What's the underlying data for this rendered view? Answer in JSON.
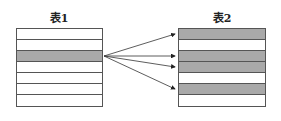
{
  "table1": {
    "title": "表1",
    "rows": [
      {
        "shaded": false
      },
      {
        "shaded": false
      },
      {
        "shaded": true
      },
      {
        "shaded": false
      },
      {
        "shaded": false
      },
      {
        "shaded": false
      },
      {
        "shaded": false
      }
    ]
  },
  "table2": {
    "title": "表2",
    "rows": [
      {
        "shaded": true
      },
      {
        "shaded": false
      },
      {
        "shaded": true
      },
      {
        "shaded": true
      },
      {
        "shaded": false
      },
      {
        "shaded": true
      },
      {
        "shaded": false
      }
    ]
  },
  "arrows": {
    "from": "table1 row 3",
    "to": [
      "table2 row 1",
      "table2 row 3",
      "table2 row 4",
      "table2 row 6"
    ]
  },
  "colors": {
    "shaded": "#a9a9a9",
    "line": "#555555"
  }
}
